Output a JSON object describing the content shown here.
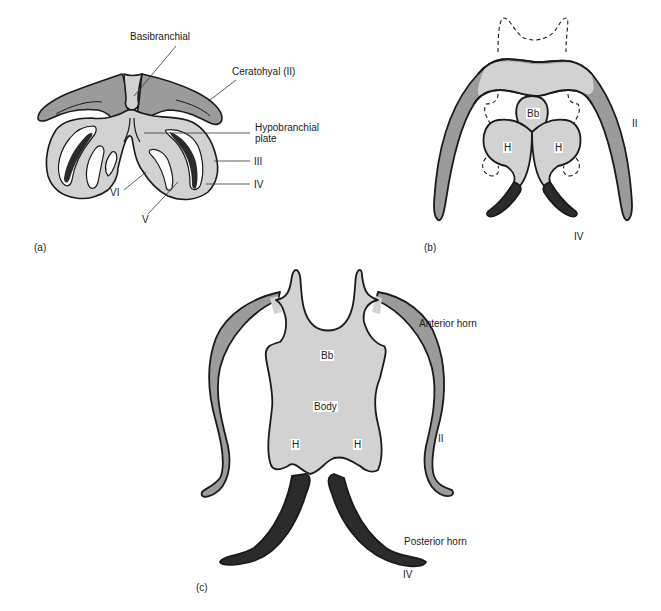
{
  "colors": {
    "light_cartilage": "#d2d2d2",
    "medium_cartilage": "#9b9b9b",
    "dark_cartilage": "#2b2b2b",
    "outline": "#1a1a1a"
  },
  "panel_a": {
    "label": "(a)",
    "callouts": {
      "basibranchial": "Basibranchial",
      "ceratohyal": "Ceratohyal (II)",
      "hypobranchial_1": "Hypobranchial",
      "hypobranchial_2": "plate",
      "arch_iii": "III",
      "arch_iv": "IV",
      "arch_v": "V",
      "arch_vi": "VI"
    }
  },
  "panel_b": {
    "label": "(b)",
    "tags": {
      "bb": "Bb",
      "h_left": "H",
      "h_right": "H"
    },
    "callouts": {
      "arch_ii": "II",
      "arch_iv": "IV"
    }
  },
  "panel_c": {
    "label": "(c)",
    "tags": {
      "bb": "Bb",
      "body": "Body",
      "h_left": "H",
      "h_right": "H"
    },
    "callouts": {
      "anterior_horn": "Anterior horn",
      "arch_ii": "II",
      "posterior_horn": "Posterior horn",
      "arch_iv": "IV"
    }
  }
}
